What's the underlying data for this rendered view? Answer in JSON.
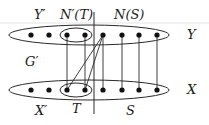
{
  "diagram": {
    "type": "bipartite-graph",
    "labels": {
      "y_prime": "Y′",
      "n_prime_t": "N′(T)",
      "n_s": "N(S)",
      "y": "Y",
      "g_prime": "G′",
      "x_prime": "X′",
      "t": "T",
      "s": "S",
      "x": "X"
    },
    "top_row": {
      "set": "Y",
      "vertex_count": 8,
      "highlighted_subset": "N′(T)",
      "highlighted_indices": [
        3,
        4
      ]
    },
    "bottom_row": {
      "set": "X",
      "vertex_count": 8,
      "highlighted_subset": "T",
      "highlighted_indices": [
        3,
        4
      ]
    },
    "divider": "vertical line separating X′/Y′ side from S/N(S) side",
    "edges": [
      {
        "from": "y3",
        "to": "x3"
      },
      {
        "from": "y4",
        "to": "x4"
      },
      {
        "from": "y5",
        "to": "x3"
      },
      {
        "from": "y5",
        "to": "x4"
      },
      {
        "from": "y5",
        "to": "x5"
      },
      {
        "from": "y6",
        "to": "x6"
      },
      {
        "from": "y7",
        "to": "x7"
      },
      {
        "from": "y8",
        "to": "x8"
      }
    ]
  }
}
